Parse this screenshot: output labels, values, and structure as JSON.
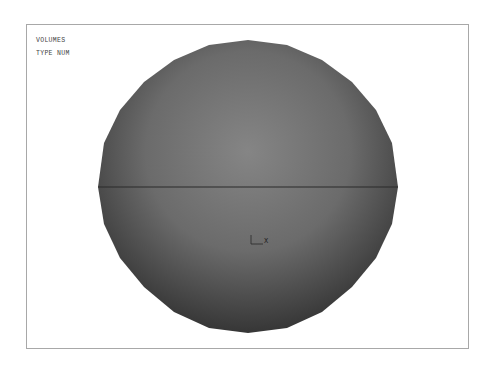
{
  "viewport": {
    "legend": {
      "line1": "VOLUMES",
      "line2": "TYPE NUM"
    },
    "model": {
      "shape": "sphere-volume",
      "fill_center_color": "#808080",
      "fill_edge_color": "#363636",
      "equator_line_color": "#2a2a2a"
    },
    "triad": {
      "x_label": "X"
    },
    "frame_color": "#a8a8a8"
  }
}
